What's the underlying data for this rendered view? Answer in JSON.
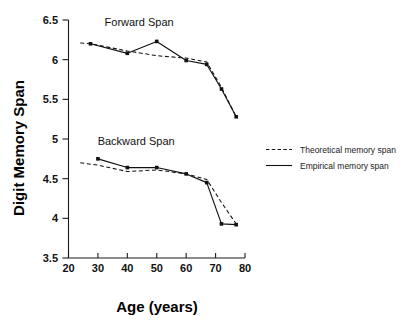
{
  "chart_data": {
    "type": "line",
    "title": "",
    "xlabel": "Age (years)",
    "ylabel": "Digit Memory Span",
    "xlim": [
      20,
      80
    ],
    "ylim": [
      3.5,
      6.5
    ],
    "xticks": [
      20,
      30,
      40,
      50,
      60,
      70,
      80
    ],
    "yticks": [
      3.5,
      4,
      4.5,
      5,
      5.5,
      6,
      6.5
    ],
    "xtick_labels": [
      "20",
      "30",
      "40",
      "50",
      "60",
      "70",
      "80"
    ],
    "ytick_labels": [
      "3.5",
      "4",
      "4.5",
      "5",
      "5.5",
      "6",
      "6.5"
    ],
    "grid": false,
    "legend_position": "right",
    "annotations": [
      {
        "text": "Forward Span",
        "x": 44,
        "y": 6.42
      },
      {
        "text": "Backward Span",
        "x": 43,
        "y": 4.93
      }
    ],
    "legend": [
      {
        "label": "Theoretical memory span",
        "style": "dashed"
      },
      {
        "label": "Empirical memory span",
        "style": "solid"
      }
    ],
    "panels": [
      {
        "name": "Forward Span",
        "series": [
          {
            "name": "Empirical memory span",
            "style": "solid",
            "markers": true,
            "x": [
              27.5,
              40,
              50,
              60,
              67,
              72,
              77
            ],
            "values": [
              6.2,
              6.08,
              6.23,
              5.99,
              5.94,
              5.63,
              5.28
            ]
          },
          {
            "name": "Theoretical memory span",
            "style": "dashed",
            "markers": false,
            "x": [
              24,
              27.5,
              40,
              50,
              60,
              67,
              72,
              77
            ],
            "values": [
              6.21,
              6.2,
              6.11,
              6.05,
              6.02,
              5.97,
              5.65,
              5.28
            ]
          }
        ]
      },
      {
        "name": "Backward Span",
        "series": [
          {
            "name": "Empirical memory span",
            "style": "solid",
            "markers": true,
            "x": [
              30,
              40,
              50,
              60,
              67,
              72,
              77
            ],
            "values": [
              4.75,
              4.64,
              4.64,
              4.56,
              4.45,
              3.93,
              3.92
            ]
          },
          {
            "name": "Theoretical memory span",
            "style": "dashed",
            "markers": false,
            "x": [
              24,
              30,
              40,
              50,
              60,
              67,
              72,
              77
            ],
            "values": [
              4.7,
              4.67,
              4.59,
              4.61,
              4.56,
              4.49,
              4.2,
              3.93
            ]
          }
        ]
      }
    ]
  }
}
